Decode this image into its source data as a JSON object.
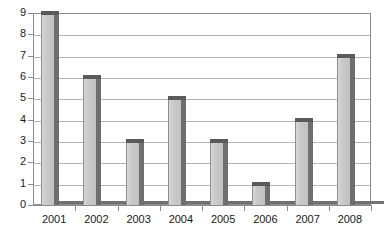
{
  "chart_data": {
    "type": "bar",
    "title": "",
    "xlabel": "",
    "ylabel": "",
    "categories": [
      "2001",
      "2002",
      "2003",
      "2004",
      "2005",
      "2006",
      "2007",
      "2008"
    ],
    "values": [
      9,
      6,
      3,
      5,
      3,
      1,
      4,
      7
    ],
    "ylim": [
      0,
      9
    ],
    "y_ticks": [
      "0",
      "1",
      "2",
      "3",
      "4",
      "5",
      "6",
      "7",
      "8",
      "9"
    ],
    "grid": true,
    "legend": "none",
    "bar_style": "3d-gray",
    "colors": {
      "bar_face": "#c9c9c9",
      "bar_side": "#6e6e6e",
      "bar_top": "#5a5a5a",
      "gridline": "#b4b4b4",
      "axis": "#8c8c8c",
      "text": "#1a1a1a",
      "background": "#ffffff"
    }
  }
}
